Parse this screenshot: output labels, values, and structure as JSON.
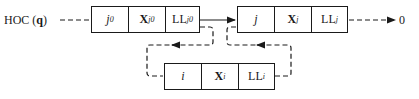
{
  "head_label": {
    "prefix": "HOC (",
    "arg": "q",
    "suffix": ")"
  },
  "terminal_label": "0",
  "nodes": [
    {
      "id": "j0",
      "cells": [
        {
          "main": "j",
          "sub": "0"
        },
        {
          "main": "X",
          "sub": "j0"
        },
        {
          "main": "LL",
          "sub": "j0"
        }
      ]
    },
    {
      "id": "j",
      "cells": [
        {
          "main": "j",
          "sub": ""
        },
        {
          "main": "X",
          "sub": "j"
        },
        {
          "main": "LL",
          "sub": "j"
        }
      ]
    },
    {
      "id": "i",
      "cells": [
        {
          "main": "i",
          "sub": ""
        },
        {
          "main": "X",
          "sub": "i"
        },
        {
          "main": "LL",
          "sub": "i"
        }
      ]
    }
  ],
  "colors": {
    "stroke": "#1a1a1a",
    "background": "#ffffff"
  }
}
